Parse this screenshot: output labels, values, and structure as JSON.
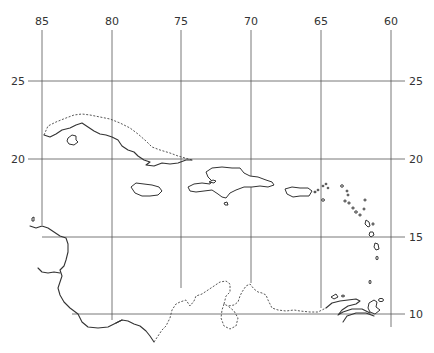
{
  "map": {
    "region": "Caribbean",
    "longitude_labels": [
      {
        "label": "85",
        "x": 42
      },
      {
        "label": "80",
        "x": 112
      },
      {
        "label": "75",
        "x": 181
      },
      {
        "label": "70",
        "x": 251
      },
      {
        "label": "65",
        "x": 321
      },
      {
        "label": "60",
        "x": 391
      }
    ],
    "latitude_labels_left": [
      {
        "label": "25",
        "y": 81
      },
      {
        "label": "20",
        "y": 159
      }
    ],
    "latitude_labels_right": [
      {
        "label": "25",
        "y": 81
      },
      {
        "label": "20",
        "y": 159
      },
      {
        "label": "15",
        "y": 237
      },
      {
        "label": "10",
        "y": 314
      }
    ],
    "features": [
      "Cuba",
      "Isle of Youth",
      "Jamaica",
      "Hispaniola",
      "Puerto Rico",
      "Lesser Antilles",
      "Central America coast",
      "Colombia/Venezuela coast",
      "Trinidad"
    ],
    "colors": {
      "line": "#333333",
      "grid": "#555555",
      "background": "#ffffff"
    }
  }
}
